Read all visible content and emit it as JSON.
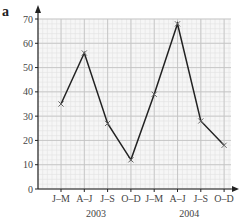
{
  "panel_label": "a",
  "chart_data": {
    "type": "line",
    "title": "",
    "xlabel": "",
    "ylabel": "",
    "categories": [
      "J–M",
      "A–J",
      "J–S",
      "O–D",
      "J–M",
      "A–J",
      "J–S",
      "O–D"
    ],
    "year_groups": [
      {
        "label": "2003",
        "span": [
          0,
          3
        ]
      },
      {
        "label": "2004",
        "span": [
          4,
          7
        ]
      }
    ],
    "series": [
      {
        "name": "series",
        "values": [
          35,
          56,
          27,
          12,
          39,
          68,
          28,
          18
        ],
        "marker": "x",
        "color": "#222222"
      }
    ],
    "ylim": [
      0,
      70
    ],
    "yticks": [
      0,
      10,
      20,
      30,
      40,
      50,
      60,
      70
    ],
    "grid": true,
    "legend": null
  },
  "axis": {
    "y_tick_labels": [
      "0",
      "10",
      "20",
      "30",
      "40",
      "50",
      "60",
      "70"
    ],
    "x_tick_labels": [
      "J–M",
      "A–J",
      "J–S",
      "O–D",
      "J–M",
      "A–J",
      "J–S",
      "O–D"
    ],
    "year_labels": [
      "2003",
      "2004"
    ]
  }
}
